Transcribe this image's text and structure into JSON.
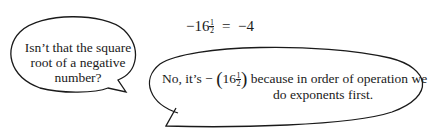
{
  "equation": {
    "lhs_sign": "−",
    "base": "16",
    "exp_num": "1",
    "exp_den": "2",
    "equals": "=",
    "rhs": "−4"
  },
  "bubble_left": {
    "line1": "Isn’t that the square",
    "line2": "root of a negative",
    "line3": "number?"
  },
  "bubble_right": {
    "prefix": "No, it’s −",
    "open_paren": "(",
    "base": "16",
    "exp_num": "1",
    "exp_den": "2",
    "close_paren": ")",
    "line1_rest": " because in order of operation we",
    "line2": "do exponents first."
  },
  "colors": {
    "stroke": "#1a1a1a",
    "background": "#ffffff"
  }
}
